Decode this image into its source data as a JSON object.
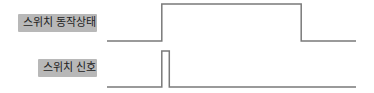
{
  "diagram": {
    "type": "timing-diagram",
    "signals": [
      {
        "id": "switch-state",
        "label": "스위치 동작상태",
        "description": "goes high at the signal pulse and stays high until later falling edge",
        "waveform": [
          {
            "t": 0,
            "level": 0
          },
          {
            "t": 0.22,
            "level": 1
          },
          {
            "t": 0.78,
            "level": 0
          },
          {
            "t": 1,
            "level": 0
          }
        ]
      },
      {
        "id": "switch-signal",
        "label": "스위치 신호",
        "description": "short pulse",
        "waveform": [
          {
            "t": 0,
            "level": 0
          },
          {
            "t": 0.22,
            "level": 1
          },
          {
            "t": 0.25,
            "level": 0
          },
          {
            "t": 1,
            "level": 0
          }
        ]
      }
    ],
    "colors": {
      "line": "#7a7a7a",
      "label_bg": "#b8b8b8",
      "label_text": "#222222"
    }
  }
}
